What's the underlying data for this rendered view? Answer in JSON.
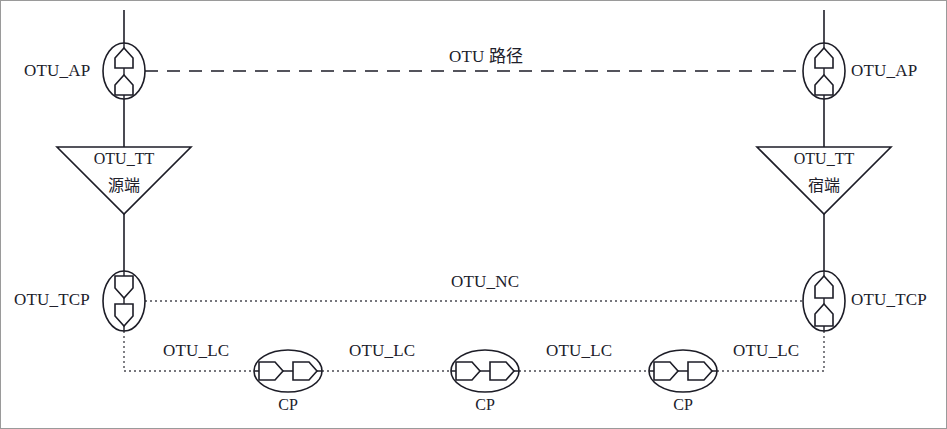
{
  "diagram": {
    "nodes": {
      "ap_left": {
        "label": "OTU_AP",
        "icon": "access-point-icon"
      },
      "ap_right": {
        "label": "OTU_AP",
        "icon": "access-point-icon"
      },
      "tt_left": {
        "label": "OTU_TT",
        "sub_label": "源端",
        "icon": "trail-termination-icon"
      },
      "tt_right": {
        "label": "OTU_TT",
        "sub_label": "宿端",
        "icon": "trail-termination-icon"
      },
      "tcp_left": {
        "label": "OTU_TCP",
        "icon": "termination-connection-point-icon"
      },
      "tcp_right": {
        "label": "OTU_TCP",
        "icon": "termination-connection-point-icon"
      },
      "cp_1": {
        "label": "CP",
        "icon": "connection-point-icon"
      },
      "cp_2": {
        "label": "CP",
        "icon": "connection-point-icon"
      },
      "cp_3": {
        "label": "CP",
        "icon": "connection-point-icon"
      }
    },
    "links": {
      "path": {
        "label": "OTU 路径",
        "style": "dashed"
      },
      "nc": {
        "label": "OTU_NC",
        "style": "dotted"
      },
      "lc_1": {
        "label": "OTU_LC",
        "style": "dotted"
      },
      "lc_2": {
        "label": "OTU_LC",
        "style": "dotted"
      },
      "lc_3": {
        "label": "OTU_LC",
        "style": "dotted"
      },
      "lc_4": {
        "label": "OTU_LC",
        "style": "dotted"
      }
    },
    "colors": {
      "stroke": "#1d1d27",
      "background": "#ffffff",
      "border": "#8a8a8a",
      "text": "#20202a"
    }
  }
}
